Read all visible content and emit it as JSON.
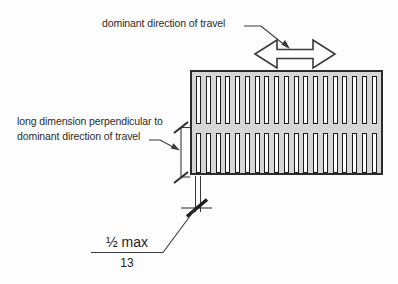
{
  "figure": {
    "type": "technical-diagram",
    "background": "#fdfdfd",
    "line_color": "#3a3a3a",
    "labels": {
      "dominant_direction": "dominant direction of travel",
      "long_dimension_line1": "long dimension perpendicular to",
      "long_dimension_line2": "dominant direction of travel",
      "dimension_imperial": "½ max",
      "dimension_metric": "13"
    },
    "icons": {
      "travel_direction": "double-arrow-horizontal-icon"
    },
    "grate": {
      "rows": 2,
      "columns": 19,
      "fill": "#d6d6d6",
      "slot_fill": "#ffffff",
      "border_color": "#2b2b2b"
    },
    "dimensions_annotated": {
      "opening_width": "½ max (13)"
    }
  }
}
